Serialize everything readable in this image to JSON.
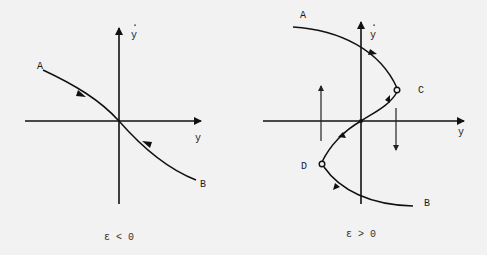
{
  "panels": [
    {
      "id": "left",
      "caption": "ε < 0",
      "axes": {
        "horizontal_label": "y",
        "vertical_label": "y",
        "vertical_label_dot": "·"
      },
      "points": {
        "A": "A",
        "B": "B"
      },
      "description": "Single monotone decreasing branch from A through origin to B; flow arrows point toward origin (stable)."
    },
    {
      "id": "right",
      "caption": "ε > 0",
      "axes": {
        "horizontal_label": "y",
        "vertical_label": "y",
        "vertical_label_dot": "·"
      },
      "points": {
        "A": "A",
        "B": "B",
        "C": "C",
        "D": "D"
      },
      "description": "S-shaped curve A→C→origin→D→B with turning points C and D (open circles); vertical jump arrows: up on left, down on right."
    }
  ],
  "colors": {
    "background": "#f2f2f2",
    "ink": "#111111"
  }
}
